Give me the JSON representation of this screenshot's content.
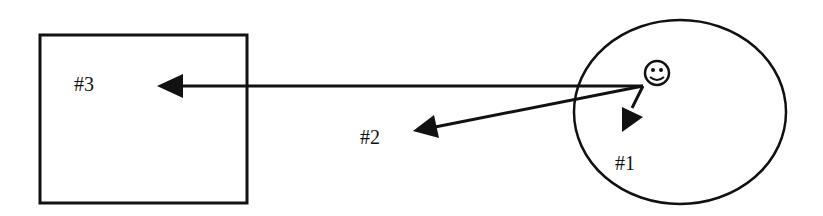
{
  "diagram": {
    "labels": {
      "target3": "#3",
      "target2": "#2",
      "target1": "#1"
    },
    "icons": {
      "agent": "smiley-face-icon"
    },
    "colors": {
      "stroke": "#111111",
      "background": "#ffffff"
    }
  }
}
